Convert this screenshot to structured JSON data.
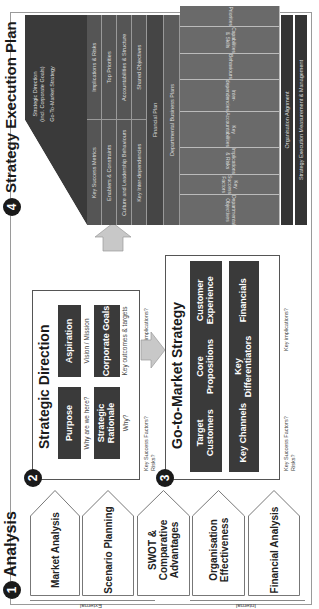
{
  "analysis": {
    "number": "1",
    "title": "Analysis",
    "external_label": "External",
    "internal_label": "Internal",
    "items": [
      {
        "label": "Market Analysis"
      },
      {
        "label": "Scenario Planning"
      },
      {
        "label": "SWOT & Comparative Advantages"
      },
      {
        "label": "Organisation Effectiveness"
      },
      {
        "label": "Financial Analysis"
      }
    ]
  },
  "strategic_direction": {
    "number": "2",
    "title": "Strategic Direction",
    "boxes": [
      {
        "label": "Purpose",
        "note": "Why are we here?"
      },
      {
        "label": "Aspiration",
        "note": "Vision / Mission"
      },
      {
        "label": "Strategic Rationale",
        "note": "Why?"
      },
      {
        "label": "Corporate Goals",
        "note": "Key outcomes & targets"
      }
    ],
    "key_success": "Key Success Factors? Risks?",
    "key_implications": "Key implications?"
  },
  "go_to_market": {
    "number": "3",
    "title": "Go-to-Market Strategy",
    "row1": [
      "Target Customers",
      "Core Propositions",
      "Customer Experience"
    ],
    "row2": [
      "Key Channels",
      "Key Differentiators",
      "Financials"
    ],
    "key_success": "Key Success Factors? Risks?",
    "key_implications": "Key implications?"
  },
  "execution_plan": {
    "number": "4",
    "title": "Strategy Execution Plan",
    "roof": {
      "line1": "Strategic Direction",
      "line2": "(incl. Corporate Goals)",
      "line3": "Go-To-Market Strategy"
    },
    "split_rows": [
      {
        "left": "Key Success Metrics",
        "right": "Implications & Risks"
      },
      {
        "left": "Enablers & Constraints",
        "right": "Top Priorities"
      },
      {
        "left": "Culture and Leadership Behaviours",
        "right": "Accountabilities & Structure"
      },
      {
        "left": "Key Inter-dependencies",
        "right": "Shared Objectives"
      }
    ],
    "financial_plan": "Financial Plan",
    "departmental_plans": "Departmental Business Plans",
    "departments": [
      "Departmental Objectives",
      "Key Success Factors",
      "Implications & Risks",
      "Key Accountabilities",
      "Inter-dependencies",
      "Behaviours",
      "Capabilities & Skills",
      "Priorities"
    ],
    "org_alignment": "Organisation Alignment",
    "measurement": "Strategy Execution Measurement & Management"
  },
  "colors": {
    "dark_box": "#3a3a3a",
    "exec_dark": "#343434",
    "exec_mid": "#555555",
    "exec_light": "#6a6a6a",
    "arrow_fill": "#c8c8c8",
    "border": "#9a9a9a"
  }
}
